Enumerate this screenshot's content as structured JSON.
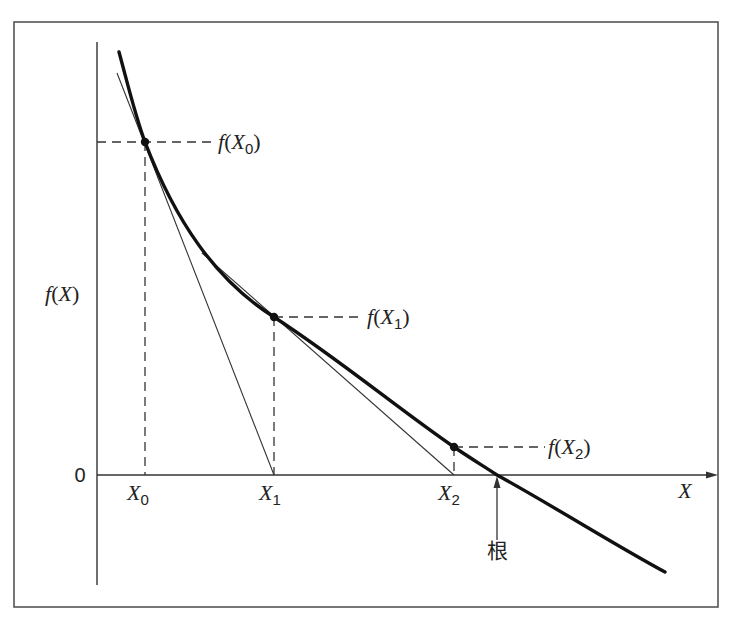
{
  "diagram": {
    "colors": {
      "frame": "#555555",
      "curve": "#111111",
      "tangent": "#333333",
      "axis": "#333333",
      "dashed": "#333333",
      "background": "#ffffff"
    },
    "axes": {
      "y_label_func": "f",
      "y_label_var": "X",
      "x_label": "X",
      "origin_label": "0"
    },
    "points": [
      {
        "id": "x0",
        "x_label": "X",
        "x_sub": "0",
        "f_label": "f",
        "f_var": "X",
        "f_sub": "0"
      },
      {
        "id": "x1",
        "x_label": "X",
        "x_sub": "1",
        "f_label": "f",
        "f_var": "X",
        "f_sub": "1"
      },
      {
        "id": "x2",
        "x_label": "X",
        "x_sub": "2",
        "f_label": "f",
        "f_var": "X",
        "f_sub": "2"
      }
    ],
    "root_label": "根"
  }
}
